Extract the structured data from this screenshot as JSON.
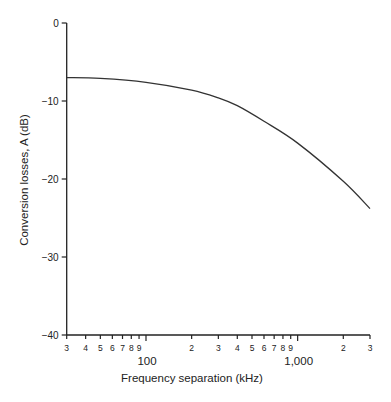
{
  "chart_data": {
    "type": "line",
    "title": "",
    "xlabel": "Frequency separation (kHz)",
    "ylabel": "Conversion losses, A  (dB)",
    "xscale": "log",
    "xlim": [
      30,
      3000
    ],
    "ylim": [
      -40,
      0
    ],
    "grid": false,
    "legend": null,
    "y_ticks": [
      0,
      -10,
      -20,
      -30,
      -40
    ],
    "y_tick_labels": [
      "0",
      "−10",
      "−20",
      "−30",
      "−40"
    ],
    "x_ticks": [
      30,
      40,
      50,
      60,
      70,
      80,
      90,
      100,
      200,
      300,
      400,
      500,
      600,
      700,
      800,
      900,
      1000,
      2000,
      3000
    ],
    "x_tick_labels": [
      "3",
      "4",
      "5",
      "6",
      "7",
      "8",
      "9",
      "",
      "2",
      "3",
      "4",
      "5",
      "6",
      "7",
      "8",
      "9",
      "",
      "2",
      "3"
    ],
    "x_major_labels": [
      {
        "value": 100,
        "label": "100"
      },
      {
        "value": 1000,
        "label": "1,000"
      }
    ],
    "series": [
      {
        "name": "Conversion losses",
        "color": "#333333",
        "x": [
          30,
          50,
          100,
          200,
          300,
          400,
          600,
          1000,
          2000,
          3000
        ],
        "y": [
          -7.0,
          -7.1,
          -7.6,
          -8.6,
          -9.6,
          -10.6,
          -12.6,
          -15.4,
          -20.3,
          -23.8
        ]
      }
    ]
  }
}
